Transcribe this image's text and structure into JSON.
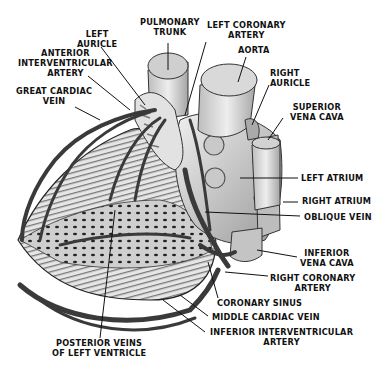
{
  "diagram": {
    "labels": {
      "pulmonary_trunk": "PULMONARY\nTRUNK",
      "left_coronary_artery": "LEFT CORONARY\nARTERY",
      "left_auricle": "LEFT\nAURICLE",
      "aorta": "AORTA",
      "anterior_interventricular_artery": "ANTERIOR\nINTERVENTRICULAR\nARTERY",
      "right_auricle": "RIGHT\nAURICLE",
      "great_cardiac_vein": "GREAT CARDIAC\nVEIN",
      "superior_vena_cava": "SUPERIOR\nVENA CAVA",
      "left_atrium": "LEFT ATRIUM",
      "right_atrium": "RIGHT ATRIUM",
      "oblique_vein": "OBLIQUE VEIN",
      "inferior_vena_cava": "INFERIOR\nVENA CAVA",
      "right_coronary_artery": "RIGHT CORONARY\nARTERY",
      "coronary_sinus": "CORONARY SINUS",
      "middle_cardiac_vein": "MIDDLE CARDIAC VEIN",
      "inferior_interventricular_artery": "INFERIOR INTERVENTRICULAR\nARTERY",
      "posterior_veins_of_left_ventricle": "POSTERIOR VEINS\nOF LEFT VENTRICLE"
    },
    "colors": {
      "ink": "#111111",
      "vessel": "#3a3a3a",
      "tissue": "#d9d9d9",
      "background": "#ffffff"
    }
  }
}
